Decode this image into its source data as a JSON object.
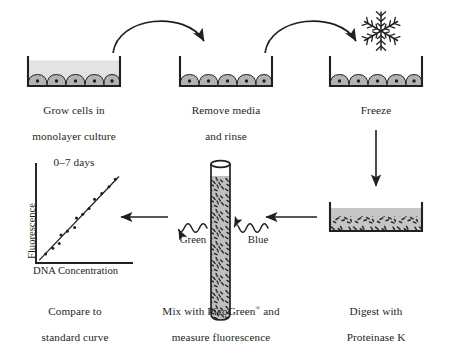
{
  "diagram": {
    "colors": {
      "ink": "#231f20",
      "media_fill": "#e3e3e3",
      "cell_fill": "#b3b3b3",
      "lysate_fill": "#c6c6c6",
      "debris": "#2b2b2b",
      "tube_fill": "#bfbfbf"
    },
    "steps": [
      {
        "id": "grow",
        "icon": "culture-dish-with-media",
        "caption_lines": [
          "Grow cells in",
          "monolayer culture",
          "0–7 days"
        ]
      },
      {
        "id": "remove-media",
        "icon": "culture-dish-empty",
        "caption_lines": [
          "Remove media",
          "and rinse"
        ]
      },
      {
        "id": "freeze",
        "icon": "culture-dish-frozen",
        "caption_lines": [
          "Freeze"
        ]
      },
      {
        "id": "digest",
        "icon": "culture-dish-lysate",
        "caption_lines": [
          "Digest with",
          "Proteinase K"
        ]
      },
      {
        "id": "mix-picogreen",
        "icon": "test-tube",
        "caption_lines": [
          "Mix with PicoGreen® and",
          "measure fluorescence"
        ]
      },
      {
        "id": "standard-curve",
        "icon": "scatter-plot",
        "caption_lines": [
          "Compare to",
          "standard curve"
        ]
      }
    ],
    "decorations": {
      "snowflake": "snowflake-icon"
    },
    "wave_labels": [
      {
        "id": "green",
        "text": "Green"
      },
      {
        "id": "blue",
        "text": "Blue"
      }
    ],
    "arrows": [
      {
        "id": "arc-1",
        "kind": "curved-arrow",
        "from": "grow",
        "to": "remove-media"
      },
      {
        "id": "arc-2",
        "kind": "curved-arrow",
        "from": "remove-media",
        "to": "freeze"
      },
      {
        "id": "down-1",
        "kind": "straight-arrow-down",
        "from": "freeze",
        "to": "digest"
      },
      {
        "id": "left-1",
        "kind": "straight-arrow-left",
        "from": "digest",
        "to": "mix-picogreen"
      },
      {
        "id": "left-2",
        "kind": "straight-arrow-left",
        "from": "mix-picogreen",
        "to": "standard-curve"
      }
    ]
  },
  "chart_data": {
    "type": "scatter",
    "title": "",
    "xlabel": "DNA Concentration",
    "ylabel": "Fluorescence",
    "xlim": [
      0,
      10
    ],
    "ylim": [
      0,
      10
    ],
    "grid": false,
    "legend": "none",
    "points": [
      {
        "x": 0.9,
        "y": 0.8
      },
      {
        "x": 1.7,
        "y": 1.4
      },
      {
        "x": 2.4,
        "y": 1.9
      },
      {
        "x": 2.6,
        "y": 2.8
      },
      {
        "x": 3.3,
        "y": 3.2
      },
      {
        "x": 4.1,
        "y": 3.6
      },
      {
        "x": 4.3,
        "y": 4.6
      },
      {
        "x": 5.0,
        "y": 5.0
      },
      {
        "x": 5.7,
        "y": 5.6
      },
      {
        "x": 6.3,
        "y": 6.6
      },
      {
        "x": 7.1,
        "y": 7.2
      },
      {
        "x": 7.9,
        "y": 7.9
      },
      {
        "x": 8.6,
        "y": 8.7
      }
    ],
    "fit_line": {
      "x0": 0.2,
      "y0": 0.15,
      "x1": 9.0,
      "y1": 9.0
    }
  }
}
